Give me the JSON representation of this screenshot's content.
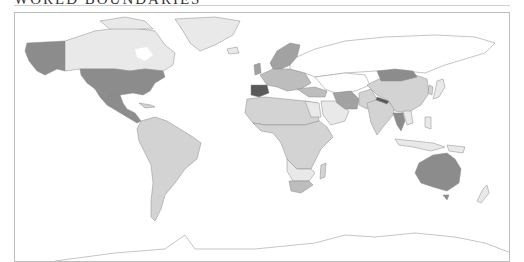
{
  "header": {
    "title": "WORLD BOUNDARIES"
  },
  "map": {
    "type": "choropleth",
    "projection": "equirectangular-like world map",
    "palette": {
      "none": "#ffffff",
      "light": "#e9e9e9",
      "medium_light": "#d3d3d3",
      "medium": "#bdbdbd",
      "medium_dark": "#a2a2a2",
      "dark": "#8c8c8c",
      "darkest": "#5a5a5a",
      "stroke": "#8a8a8a",
      "frame": "#bdbdbd"
    },
    "regions": [
      {
        "name": "Alaska",
        "shade": "dark"
      },
      {
        "name": "Canada",
        "shade": "light"
      },
      {
        "name": "Greenland",
        "shade": "light"
      },
      {
        "name": "United States",
        "shade": "dark"
      },
      {
        "name": "Mexico",
        "shade": "dark"
      },
      {
        "name": "Central America",
        "shade": "dark"
      },
      {
        "name": "South America",
        "shade": "medium_light"
      },
      {
        "name": "Scandinavia",
        "shade": "medium_dark"
      },
      {
        "name": "Western Europe",
        "shade": "medium"
      },
      {
        "name": "Spain",
        "shade": "darkest"
      },
      {
        "name": "Russia",
        "shade": "none"
      },
      {
        "name": "North Africa",
        "shade": "medium_light"
      },
      {
        "name": "Sub-Saharan Africa",
        "shade": "medium_light"
      },
      {
        "name": "Southern Africa",
        "shade": "light"
      },
      {
        "name": "South Africa",
        "shade": "medium"
      },
      {
        "name": "Madagascar",
        "shade": "medium_light"
      },
      {
        "name": "Arabian Peninsula",
        "shade": "light"
      },
      {
        "name": "Iran",
        "shade": "medium_dark"
      },
      {
        "name": "Mongolia",
        "shade": "dark"
      },
      {
        "name": "China",
        "shade": "medium_light"
      },
      {
        "name": "India",
        "shade": "medium_light"
      },
      {
        "name": "Nepal",
        "shade": "darkest"
      },
      {
        "name": "Thailand",
        "shade": "dark"
      },
      {
        "name": "Japan",
        "shade": "light"
      },
      {
        "name": "Southeast Asia Islands",
        "shade": "light"
      },
      {
        "name": "Australia",
        "shade": "dark"
      },
      {
        "name": "New Zealand",
        "shade": "light"
      },
      {
        "name": "Antarctica",
        "shade": "none"
      }
    ]
  }
}
